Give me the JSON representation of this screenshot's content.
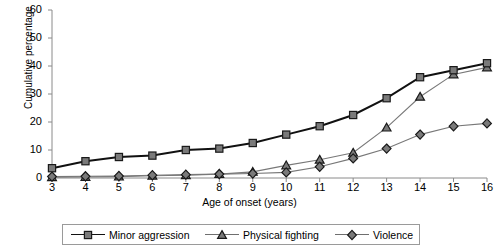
{
  "chart_data": {
    "type": "line",
    "title": "",
    "xlabel": "Age of onset (years)",
    "ylabel": "Cumulative percentage",
    "x": [
      3,
      4,
      5,
      6,
      7,
      8,
      9,
      10,
      11,
      12,
      13,
      14,
      15,
      16
    ],
    "xlim": [
      3,
      16
    ],
    "ylim": [
      0,
      60
    ],
    "yticks": [
      0,
      10,
      20,
      30,
      40,
      50,
      60
    ],
    "xticks": [
      3,
      4,
      5,
      6,
      7,
      8,
      9,
      10,
      11,
      12,
      13,
      14,
      15,
      16
    ],
    "grid": false,
    "legend_position": "bottom",
    "series": [
      {
        "name": "Minor aggression",
        "marker": "square",
        "color": "#111111",
        "values": [
          3.5,
          6,
          7.5,
          8,
          10,
          10.5,
          12.5,
          15.5,
          18.5,
          22.5,
          28.5,
          36,
          38.5,
          41
        ]
      },
      {
        "name": "Physical fighting",
        "marker": "triangle",
        "color": "#6f6f6f",
        "values": [
          0.3,
          0.4,
          0.5,
          0.8,
          1,
          1.4,
          2.2,
          4.5,
          6.5,
          9,
          18,
          29,
          37,
          39.5
        ]
      },
      {
        "name": "Violence",
        "marker": "diamond",
        "color": "#6f6f6f",
        "values": [
          0.5,
          0.6,
          0.7,
          1,
          1.2,
          1.4,
          1.6,
          2,
          4,
          7,
          10.5,
          15.5,
          18.5,
          19.5
        ]
      }
    ]
  },
  "axes": {
    "y_tick_labels": [
      "60",
      "50",
      "40",
      "30",
      "20",
      "10",
      "0"
    ],
    "x_tick_labels": [
      "3",
      "4",
      "5",
      "6",
      "7",
      "8",
      "9",
      "10",
      "11",
      "12",
      "13",
      "14",
      "15",
      "16"
    ],
    "x_title": "Age of onset (years)",
    "y_title": "Cumulative percentage"
  },
  "legend": {
    "items": [
      {
        "label": "Minor aggression",
        "marker": "square-marker"
      },
      {
        "label": "Physical fighting",
        "marker": "triangle-marker"
      },
      {
        "label": "Violence",
        "marker": "diamond-marker"
      }
    ]
  }
}
